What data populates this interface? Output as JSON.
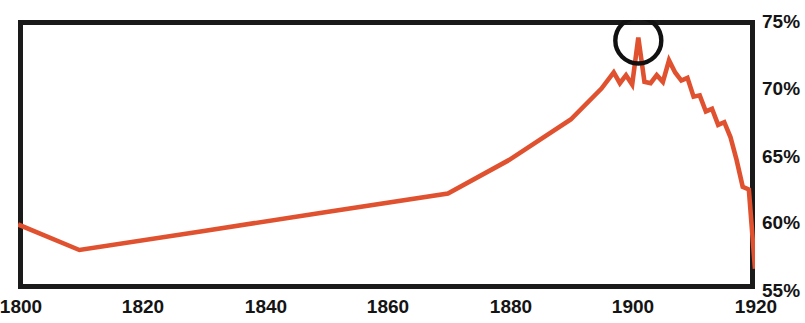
{
  "chart_data": {
    "type": "line",
    "title": "",
    "title_note": "headline cropped above top edge of image; only letter descenders visible",
    "xlabel": "",
    "ylabel": "",
    "xlim": [
      1800,
      1920
    ],
    "ylim": [
      55,
      75
    ],
    "grid": false,
    "legend": null,
    "line_color": "#e0512f",
    "frame_color": "#1a1a1a",
    "background": "#ffffff",
    "y_tick_labels": [
      "75%",
      "70%",
      "65%",
      "60%",
      "55%"
    ],
    "y_ticks": [
      75,
      70,
      65,
      60,
      55
    ],
    "x_tick_labels": [
      "1800",
      "1820",
      "1840",
      "1860",
      "1880",
      "1900",
      "1920"
    ],
    "x_ticks": [
      1800,
      1820,
      1840,
      1860,
      1880,
      1900,
      1920
    ],
    "series": [
      {
        "name": "share",
        "x": [
          1800,
          1810,
          1830,
          1850,
          1870,
          1880,
          1890,
          1895,
          1897,
          1898,
          1899,
          1900,
          1901,
          1902,
          1903,
          1904,
          1905,
          1906,
          1907,
          1908,
          1909,
          1910,
          1911,
          1912,
          1913,
          1914,
          1915,
          1916,
          1917,
          1918,
          1919,
          1920
        ],
        "values": [
          59.8,
          57.9,
          59.3,
          60.7,
          62.1,
          64.6,
          67.6,
          69.9,
          71.1,
          70.3,
          70.9,
          70.2,
          73.7,
          70.4,
          70.3,
          70.9,
          70.4,
          72.0,
          71.1,
          70.5,
          70.7,
          69.3,
          69.4,
          68.2,
          68.4,
          67.2,
          67.4,
          66.3,
          64.6,
          62.6,
          62.4,
          56.5
        ]
      }
    ],
    "annotations": [
      {
        "type": "circle",
        "shape": "circle-outline",
        "color": "#111111",
        "x": 1901,
        "y": 73.7,
        "radius_px": 23,
        "label": ""
      }
    ]
  }
}
